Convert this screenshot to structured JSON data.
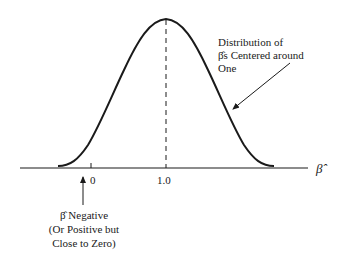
{
  "diagram": {
    "axis_label": "β̂",
    "ticks": [
      {
        "label": "0",
        "x": 91
      },
      {
        "label": "1.0",
        "x": 166
      }
    ],
    "distribution_annotation": {
      "lines": [
        "Distribution of",
        "β̂s Centered around",
        "One"
      ]
    },
    "negative_annotation": {
      "lines": [
        "β̂ Negative",
        "(Or Positive but",
        "Close to Zero)"
      ]
    },
    "colors": {
      "ink": "#1a1a1a",
      "background": "#ffffff"
    }
  }
}
